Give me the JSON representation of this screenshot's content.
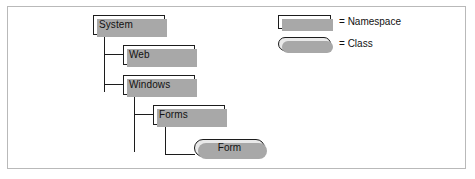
{
  "diagram": {
    "type": "hierarchy-tree",
    "nodes": [
      {
        "id": "system",
        "label": "System",
        "kind": "Namespace",
        "x": 92,
        "y": 14,
        "w": 72,
        "h": 20
      },
      {
        "id": "web",
        "label": "Web",
        "kind": "Namespace",
        "x": 122,
        "y": 44,
        "w": 72,
        "h": 20
      },
      {
        "id": "windows",
        "label": "Windows",
        "kind": "Namespace",
        "x": 122,
        "y": 74,
        "w": 72,
        "h": 20
      },
      {
        "id": "forms",
        "label": "Forms",
        "kind": "Namespace",
        "x": 152,
        "y": 104,
        "w": 72,
        "h": 20
      },
      {
        "id": "form",
        "label": "Form",
        "kind": "Class",
        "x": 193,
        "y": 138,
        "w": 71,
        "h": 18
      }
    ],
    "edges": [
      {
        "from": "system",
        "to": "web"
      },
      {
        "from": "system",
        "to": "windows"
      },
      {
        "from": "windows",
        "to": "forms"
      },
      {
        "from": "forms",
        "to": "form"
      }
    ]
  },
  "legend": {
    "items": [
      {
        "shape": "rectangle",
        "separator": "=",
        "label": "Namespace"
      },
      {
        "shape": "rounded-capsule",
        "separator": "=",
        "label": "Class"
      }
    ]
  },
  "colors": {
    "frame_border": "#b9b9b9",
    "node_border": "#1c1c1c",
    "node_fill": "#ffffff",
    "class_fill": "#e9e9e9",
    "shadow": "#a8a8a8",
    "line": "#1c1c1c",
    "text": "#111111",
    "background": "#ffffff"
  }
}
